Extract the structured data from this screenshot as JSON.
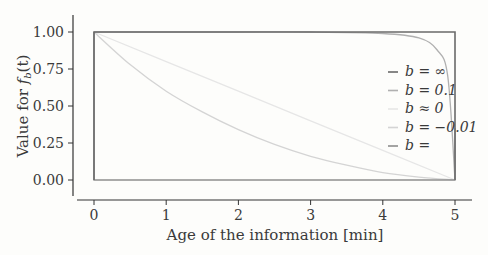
{
  "chart_data": {
    "type": "line",
    "title": "",
    "xlabel": "Age of the information [min]",
    "ylabel": "Value for f_b(t)",
    "ylabel_parts": {
      "prefix": "Value for ",
      "f": "f",
      "sub": "b",
      "suffix": "(t)"
    },
    "xlim": [
      -0.3,
      5.25
    ],
    "ylim": [
      -0.12,
      1.08
    ],
    "xticks": [
      0,
      1,
      2,
      3,
      4,
      5
    ],
    "xtick_labels": [
      "0",
      "1",
      "2",
      "3",
      "4",
      "5"
    ],
    "yticks": [
      0.0,
      0.25,
      0.5,
      0.75,
      1.0
    ],
    "ytick_labels": [
      "0.00",
      "0.25",
      "0.50",
      "0.75",
      "1.00"
    ],
    "grid": false,
    "legend_position": "right-center inside",
    "series": [
      {
        "name": "b = ∞",
        "label": "b = ∞",
        "color": "#6a6a6a",
        "x": [
          0,
          0,
          5,
          5
        ],
        "y": [
          0,
          1,
          1,
          0
        ]
      },
      {
        "name": "b = 0.1",
        "label": "b = 0.1",
        "color": "#b0b0b0",
        "x": [
          0,
          1,
          2,
          3,
          4,
          4.5,
          4.75,
          4.9,
          5
        ],
        "y": [
          1.0,
          1.0,
          1.0,
          1.0,
          0.99,
          0.96,
          0.88,
          0.7,
          0.0
        ]
      },
      {
        "name": "b ≈ 0",
        "label": "b ≈ 0",
        "color": "#e6e6e6",
        "x": [
          0,
          1,
          2,
          3,
          4,
          5
        ],
        "y": [
          1.0,
          0.8,
          0.6,
          0.4,
          0.2,
          0.0
        ]
      },
      {
        "name": "b = -0.01",
        "label": "b = −0.01",
        "color": "#d4d4d4",
        "x": [
          0,
          0.5,
          1,
          1.5,
          2,
          2.5,
          3,
          3.5,
          4,
          4.5,
          5
        ],
        "y": [
          1.0,
          0.78,
          0.6,
          0.46,
          0.34,
          0.24,
          0.16,
          0.1,
          0.05,
          0.02,
          0.0
        ]
      },
      {
        "name": "b = ",
        "label": "b = ",
        "color": "#8e8e8e",
        "x": [
          0,
          0,
          5,
          5
        ],
        "y": [
          1,
          0,
          0,
          0.35
        ]
      }
    ]
  }
}
